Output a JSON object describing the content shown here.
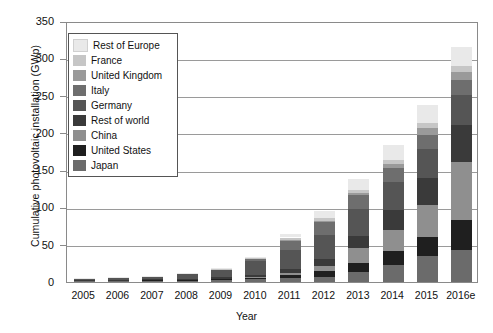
{
  "chart_data": {
    "type": "bar",
    "subtype": "stacked-bar",
    "title": "",
    "xlabel": "Year",
    "ylabel": "Cumulative photovoltaic installation (GWp)",
    "ylim": [
      0,
      350
    ],
    "yticks": [
      0,
      50,
      100,
      150,
      200,
      250,
      300,
      350
    ],
    "grid": "horizontal",
    "legend_position": "upper-left-inside",
    "categories": [
      "2005",
      "2006",
      "2007",
      "2008",
      "2009",
      "2010",
      "2011",
      "2012",
      "2013",
      "2014",
      "2015",
      "2016e"
    ],
    "series": [
      {
        "name": "Japan",
        "color": "#6b6b6b",
        "values": [
          1.4,
          1.7,
          1.9,
          2.1,
          2.6,
          3.6,
          4.9,
          6.6,
          13.6,
          23.3,
          34.4,
          42.8
        ]
      },
      {
        "name": "United States",
        "color": "#1f1f1f",
        "values": [
          0.5,
          0.6,
          0.8,
          1.2,
          1.6,
          2.5,
          4.4,
          7.8,
          12.1,
          18.3,
          25.6,
          40.3
        ]
      },
      {
        "name": "China",
        "color": "#8f8f8f",
        "values": [
          0.1,
          0.1,
          0.1,
          0.2,
          0.3,
          0.9,
          3.3,
          7.0,
          19.7,
          28.2,
          43.5,
          78.1
        ]
      },
      {
        "name": "Rest of world",
        "color": "#3a3a3a",
        "values": [
          0.4,
          0.5,
          0.7,
          1.1,
          1.7,
          3.0,
          5.4,
          9.5,
          16.2,
          26.4,
          35.6,
          48.7
        ]
      },
      {
        "name": "Germany",
        "color": "#555555",
        "values": [
          2.0,
          2.9,
          4.2,
          6.1,
          9.9,
          17.6,
          25.0,
          32.7,
          36.3,
          38.3,
          39.7,
          41.2
        ]
      },
      {
        "name": "Italy",
        "color": "#6e6e6e",
        "values": [
          0.1,
          0.1,
          0.2,
          0.5,
          1.2,
          3.5,
          12.8,
          16.4,
          18.2,
          18.6,
          18.9,
          19.3
        ]
      },
      {
        "name": "United Kingdom",
        "color": "#9a9a9a",
        "values": [
          0.0,
          0.0,
          0.0,
          0.0,
          0.0,
          0.1,
          1.0,
          1.8,
          2.9,
          5.4,
          9.1,
          11.6
        ]
      },
      {
        "name": "France",
        "color": "#c6c6c6",
        "values": [
          0.0,
          0.0,
          0.0,
          0.1,
          0.3,
          1.1,
          2.9,
          4.0,
          4.7,
          5.7,
          6.8,
          7.1
        ]
      },
      {
        "name": "Rest of Europe",
        "color": "#e9e9e9",
        "values": [
          0.1,
          0.1,
          0.2,
          0.4,
          0.8,
          1.8,
          4.5,
          9.6,
          14.9,
          19.4,
          23.6,
          26.2
        ]
      }
    ],
    "stack_order_bottom_to_top": [
      "Japan",
      "United States",
      "China",
      "Rest of world",
      "Germany",
      "Italy",
      "United Kingdom",
      "France",
      "Rest of Europe"
    ],
    "totals": [
      4.6,
      6.0,
      8.1,
      11.7,
      18.4,
      34.1,
      64.2,
      95.4,
      138.6,
      183.6,
      237.2,
      315.3
    ]
  },
  "legend": {
    "items": [
      {
        "label": "Rest of Europe",
        "color": "#e9e9e9"
      },
      {
        "label": "France",
        "color": "#c6c6c6"
      },
      {
        "label": "United Kingdom",
        "color": "#9a9a9a"
      },
      {
        "label": "Italy",
        "color": "#6e6e6e"
      },
      {
        "label": "Germany",
        "color": "#555555"
      },
      {
        "label": "Rest of world",
        "color": "#3a3a3a"
      },
      {
        "label": "China",
        "color": "#8f8f8f"
      },
      {
        "label": "United States",
        "color": "#1f1f1f"
      },
      {
        "label": "Japan",
        "color": "#6b6b6b"
      }
    ]
  },
  "axes": {
    "y_title": "Cumulative photovoltaic installation (GWp)",
    "x_title": "Year",
    "y_tick_labels": [
      "0",
      "50",
      "100",
      "150",
      "200",
      "250",
      "300",
      "350"
    ],
    "x_tick_labels": [
      "2005",
      "2006",
      "2007",
      "2008",
      "2009",
      "2010",
      "2011",
      "2012",
      "2013",
      "2014",
      "2015",
      "2016e"
    ]
  },
  "style": {
    "frame_color": "#8a8a8a",
    "grid_color": "#9a9a9a",
    "background": "#ffffff",
    "text_color": "#111111"
  }
}
